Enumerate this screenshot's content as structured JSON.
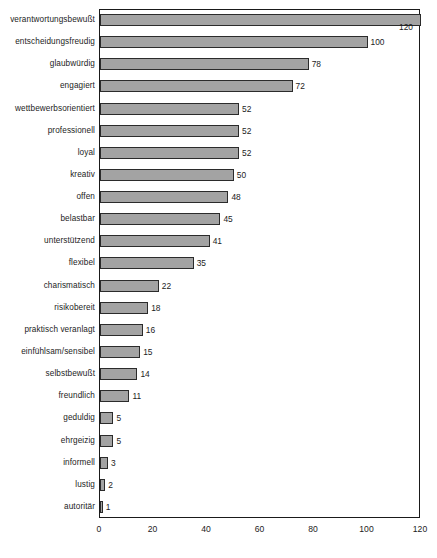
{
  "chart_data": {
    "type": "bar",
    "orientation": "horizontal",
    "title": "",
    "subtitle": "",
    "xlabel": "",
    "ylabel": "",
    "xlim": [
      0,
      120
    ],
    "xticks": [
      0,
      20,
      40,
      60,
      80,
      100,
      120
    ],
    "xtick_labels": [
      "0",
      "20",
      "40",
      "60",
      "80",
      "100",
      "120"
    ],
    "grid": false,
    "legend": false,
    "bar_color": "#a3a3a3",
    "bar_border_color": "#2b2b2b",
    "axis_color": "#1a1a1a",
    "categories": [
      "verantwortungsbewußt",
      "entscheidungsfreudig",
      "glaubwürdig",
      "engagiert",
      "wettbewerbsorientiert",
      "professionell",
      "loyal",
      "kreativ",
      "offen",
      "belastbar",
      "unterstützend",
      "flexibel",
      "charismatisch",
      "risikobereit",
      "praktisch veranlagt",
      "einfühlsam/sensibel",
      "selbstbewußt",
      "freundlich",
      "geduldig",
      "ehrgeizig",
      "informell",
      "lustig",
      "autoritär"
    ],
    "values": [
      120,
      100,
      78,
      72,
      52,
      52,
      52,
      50,
      48,
      45,
      41,
      35,
      22,
      18,
      16,
      15,
      14,
      11,
      5,
      5,
      3,
      2,
      1
    ],
    "value_labels": [
      "120",
      "100",
      "78",
      "72",
      "52",
      "52",
      "52",
      "50",
      "48",
      "45",
      "41",
      "35",
      "22",
      "18",
      "16",
      "15",
      "14",
      "11",
      "5",
      "5",
      "3",
      "2",
      "1"
    ]
  }
}
